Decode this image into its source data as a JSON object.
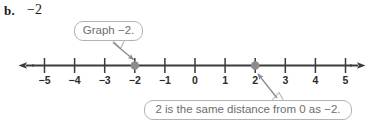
{
  "problem": {
    "letter": "b.",
    "value": "−2"
  },
  "number_line": {
    "min": -5,
    "max": 5,
    "tick_labels": [
      "−5",
      "−4",
      "−3",
      "−2",
      "−1",
      "0",
      "1",
      "2",
      "3",
      "4",
      "5"
    ],
    "plotted_points": [
      {
        "label": "−2",
        "value": -2
      },
      {
        "label": "2",
        "value": 2
      }
    ],
    "axis_color": "#3b3b3b",
    "tick_color": "#3b3b3b",
    "point_color": "#8c8c8c",
    "label_color": "#2b2b2b"
  },
  "callouts": [
    {
      "id": "graph",
      "text": "Graph −2.",
      "points_to": -2,
      "border_color": "#b3b3b3",
      "text_color": "#6d6d6d"
    },
    {
      "id": "distance",
      "text": "2 is the same distance from 0 as −2.",
      "points_to": 2,
      "border_color": "#b3b3b3",
      "text_color": "#6d6d6d"
    }
  ],
  "arrows": {
    "graph_arrow_color": "#8a8a8a",
    "distance_arrow_color": "#8a8a8a"
  }
}
